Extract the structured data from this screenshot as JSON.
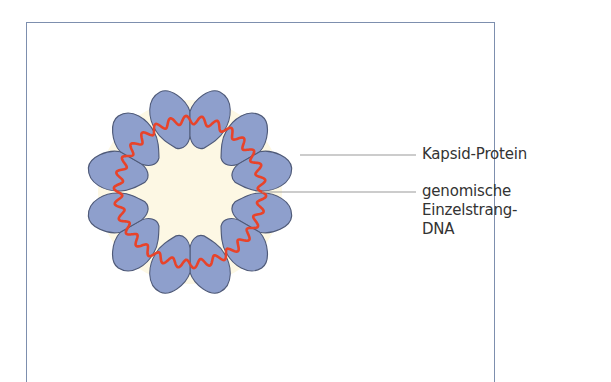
{
  "figure": {
    "type": "virus-capsid-schematic",
    "colors": {
      "frame": "#7d8fae",
      "capsid_protein": "#8e9fcc",
      "capsid_outline": "#4f5a78",
      "interior": "#fdf8e4",
      "dna": "#e8432a",
      "leader_line": "#9a9a9a",
      "text": "#333333"
    },
    "capsid": {
      "subunit_count": 12,
      "arrangement": "6 pairs around a ring"
    },
    "labels": [
      {
        "id": "capsid-protein",
        "lines": [
          "Kapsid-Protein"
        ]
      },
      {
        "id": "ssdna",
        "lines": [
          "genomische",
          "Einzelstrang-",
          "DNA"
        ]
      }
    ]
  }
}
